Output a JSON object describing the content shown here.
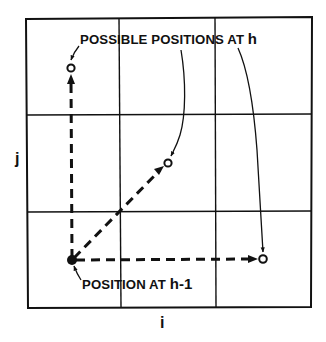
{
  "diagram": {
    "colors": {
      "ink": "#111111",
      "background": "#ffffff"
    },
    "axes": {
      "x_label": "i",
      "y_label": "j"
    },
    "grid": {
      "columns": 3,
      "rows": 3
    },
    "labels": {
      "possible_positions": {
        "text": "POSSIBLE POSITIONS AT ",
        "variable": "h"
      },
      "current_position": {
        "text": "POSITION AT ",
        "variable": "h-1"
      }
    },
    "points": {
      "origin": {
        "name": "position at h-1",
        "style": "filled"
      },
      "candidates": [
        {
          "name": "move up (j+1)",
          "style": "open"
        },
        {
          "name": "move diagonal (i+1, j+1)",
          "style": "open"
        },
        {
          "name": "move right (i+1)",
          "style": "open"
        }
      ]
    }
  }
}
